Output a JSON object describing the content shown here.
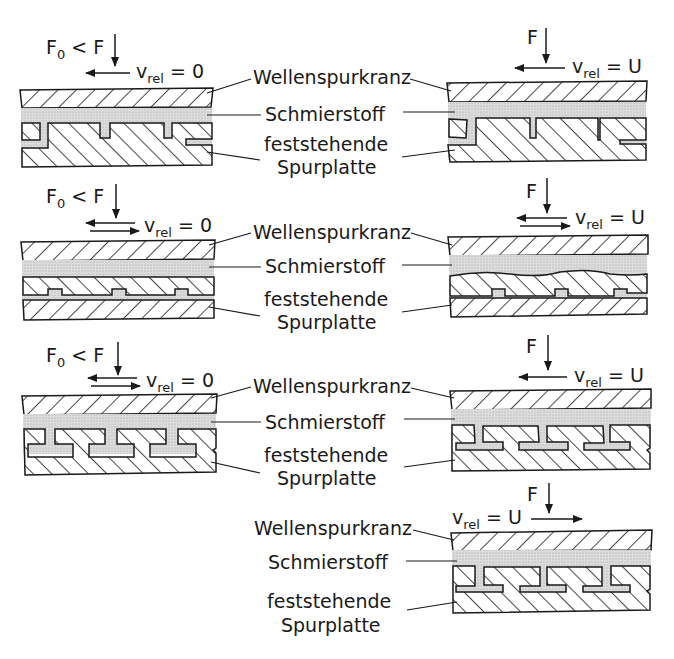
{
  "diagram": {
    "labels": {
      "collar": "Wellenspurkranz",
      "lubricant": "Schmierstoff",
      "plate_line1": "feststehende",
      "plate_line2": "Spurplatte"
    },
    "panels": [
      {
        "id": "A-left",
        "force": "F₀ < F",
        "force_main": "F",
        "force_sub": "0",
        "force_rest": " < F",
        "velocity_var": "v",
        "velocity_sub": "rel",
        "velocity_value": "= 0",
        "arrow": "left",
        "pad_type": "tilting pads (stepped, asymmetric)"
      },
      {
        "id": "A-right",
        "force_main": "F",
        "velocity_var": "v",
        "velocity_sub": "rel",
        "velocity_value": "= U",
        "arrow": "left",
        "pad_type": "tilting pads deflected under load"
      },
      {
        "id": "B-left",
        "force_main": "F",
        "force_sub": "0",
        "force_rest": " < F",
        "velocity_var": "v",
        "velocity_sub": "rel",
        "velocity_value": "= 0",
        "arrow": "both",
        "pad_type": "flexible plate on pedestals"
      },
      {
        "id": "B-right",
        "force_main": "F",
        "velocity_var": "v",
        "velocity_sub": "rel",
        "velocity_value": "= U",
        "arrow": "both",
        "pad_type": "flexible plate, wavy deformed"
      },
      {
        "id": "C-left",
        "force_main": "F",
        "force_sub": "0",
        "force_rest": " < F",
        "velocity_var": "v",
        "velocity_sub": "rel",
        "velocity_value": "= 0",
        "arrow": "both",
        "pad_type": "T-shaped symmetric pads"
      },
      {
        "id": "C-right",
        "force_main": "F",
        "velocity_var": "v",
        "velocity_sub": "rel",
        "velocity_value": "= U",
        "arrow": "left",
        "pad_type": "T-shaped pads tilted (leftward motion)"
      },
      {
        "id": "D-right",
        "force_main": "F",
        "velocity_var": "v",
        "velocity_sub": "rel",
        "velocity_value": "= U",
        "arrow": "right",
        "pad_type": "T-shaped pads tilted (rightward motion)"
      }
    ],
    "colors": {
      "ink": "#1a1a1a",
      "lubricant": "#d9d9d9",
      "background": "#ffffff"
    }
  }
}
